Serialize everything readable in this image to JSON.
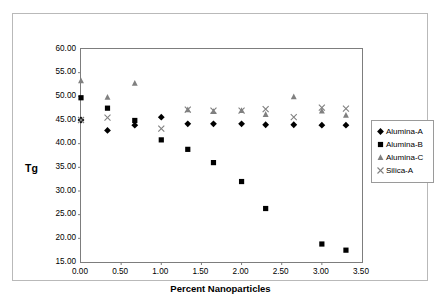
{
  "chart_data": {
    "type": "scatter",
    "title": "",
    "xlabel": "Percent Nanoparticles",
    "ylabel": "Tg",
    "xlim": [
      0.0,
      3.5
    ],
    "ylim": [
      15.0,
      60.0
    ],
    "xticks": [
      "0.00",
      "0.50",
      "1.00",
      "1.50",
      "2.00",
      "2.50",
      "3.00",
      "3.50"
    ],
    "xtick_values": [
      0.0,
      0.5,
      1.0,
      1.5,
      2.0,
      2.5,
      3.0,
      3.5
    ],
    "yticks": [
      "15.00",
      "20.00",
      "25.00",
      "30.00",
      "35.00",
      "40.00",
      "45.00",
      "50.00",
      "55.00",
      "60.00"
    ],
    "ytick_values": [
      15,
      20,
      25,
      30,
      35,
      40,
      45,
      50,
      55,
      60
    ],
    "grid": false,
    "legend_position": "right",
    "series": [
      {
        "name": "Alumina-A",
        "marker": "diamond",
        "color": "#000000",
        "points": [
          {
            "x": 0.0,
            "y": 45.0
          },
          {
            "x": 0.33,
            "y": 42.8
          },
          {
            "x": 0.67,
            "y": 43.9
          },
          {
            "x": 1.0,
            "y": 45.6
          },
          {
            "x": 1.33,
            "y": 44.2
          },
          {
            "x": 1.65,
            "y": 44.2
          },
          {
            "x": 2.0,
            "y": 44.2
          },
          {
            "x": 2.3,
            "y": 44.0
          },
          {
            "x": 2.65,
            "y": 44.0
          },
          {
            "x": 3.0,
            "y": 43.9
          },
          {
            "x": 3.3,
            "y": 43.9
          }
        ]
      },
      {
        "name": "Alumina-B",
        "marker": "square",
        "color": "#000000",
        "points": [
          {
            "x": 0.0,
            "y": 49.7
          },
          {
            "x": 0.33,
            "y": 47.5
          },
          {
            "x": 0.67,
            "y": 44.9
          },
          {
            "x": 1.0,
            "y": 40.8
          },
          {
            "x": 1.33,
            "y": 38.8
          },
          {
            "x": 1.65,
            "y": 36.0
          },
          {
            "x": 2.0,
            "y": 32.0
          },
          {
            "x": 2.3,
            "y": 26.3
          },
          {
            "x": 3.0,
            "y": 18.8
          },
          {
            "x": 3.3,
            "y": 17.5
          }
        ]
      },
      {
        "name": "Alumina-C",
        "marker": "triangle",
        "color": "#808080",
        "points": [
          {
            "x": 0.0,
            "y": 53.3
          },
          {
            "x": 0.33,
            "y": 49.8
          },
          {
            "x": 0.67,
            "y": 52.8
          },
          {
            "x": 1.33,
            "y": 47.2
          },
          {
            "x": 1.65,
            "y": 46.8
          },
          {
            "x": 2.0,
            "y": 47.0
          },
          {
            "x": 2.3,
            "y": 46.2
          },
          {
            "x": 2.65,
            "y": 49.9
          },
          {
            "x": 3.0,
            "y": 46.9
          },
          {
            "x": 3.3,
            "y": 46.0
          }
        ]
      },
      {
        "name": "Silica-A",
        "marker": "cross",
        "color": "#808080",
        "points": [
          {
            "x": 0.0,
            "y": 45.0
          },
          {
            "x": 0.33,
            "y": 45.5
          },
          {
            "x": 1.0,
            "y": 43.2
          },
          {
            "x": 1.33,
            "y": 47.2
          },
          {
            "x": 1.65,
            "y": 47.0
          },
          {
            "x": 2.0,
            "y": 47.0
          },
          {
            "x": 2.3,
            "y": 47.3
          },
          {
            "x": 2.65,
            "y": 45.6
          },
          {
            "x": 3.0,
            "y": 47.6
          },
          {
            "x": 3.3,
            "y": 47.4
          }
        ]
      }
    ]
  },
  "legend": {
    "items": [
      {
        "label": "Alumina-A",
        "marker": "diamond-marker-icon"
      },
      {
        "label": "Alumina-B",
        "marker": "square-marker-icon"
      },
      {
        "label": "Alumina-C",
        "marker": "triangle-marker-icon"
      },
      {
        "label": "Silica-A",
        "marker": "cross-marker-icon"
      }
    ]
  }
}
